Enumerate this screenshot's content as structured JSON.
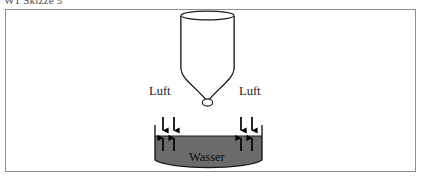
{
  "caption": {
    "text": "W1 Skizze 5"
  },
  "figure": {
    "labels": {
      "luft_left": "Luft",
      "luft_right": "Luft",
      "wasser": "Wasser"
    },
    "colors": {
      "frame_border": "#8d8d8d",
      "outline": "#1a1a1a",
      "water_fill": "#6b6b6b",
      "air_fill": "#ffffff",
      "arrow": "#000000",
      "background": "#ffffff",
      "caption_text": "#4a4a4a"
    },
    "elements": {
      "funnel": "cylinder-with-conical-neck",
      "basin": "bowl-with-curved-bottom",
      "arrows_down_count": 4,
      "arrows_up_count": 4
    }
  }
}
